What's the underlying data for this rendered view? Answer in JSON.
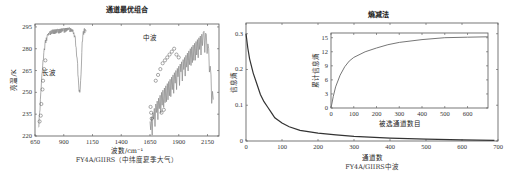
{
  "chart_data": [
    {
      "type": "line",
      "title": "通道最优组合",
      "xlabel": "波数/cm⁻¹",
      "ylabel": "亮温/K",
      "caption": "FY4A/GIIRS（中纬度夏季大气）",
      "xlim": [
        650,
        2250
      ],
      "ylim": [
        220,
        297
      ],
      "x_ticks": [
        650,
        900,
        1150,
        1400,
        1650,
        1900,
        2150
      ],
      "y_ticks": [
        220,
        235,
        250,
        265,
        280,
        295
      ],
      "grid": false,
      "annotations": [
        {
          "text": "长波",
          "x": 770,
          "y": 262
        },
        {
          "text": "中波",
          "x": 1650,
          "y": 286
        }
      ],
      "series": [
        {
          "name": "长波亮温谱",
          "x": [
            680,
            690,
            700,
            710,
            720,
            730,
            740,
            760,
            780,
            800,
            850,
            900,
            950,
            980,
            1000,
            1020,
            1030,
            1040,
            1050,
            1060,
            1070,
            1080,
            1090,
            1095
          ],
          "y": [
            226,
            236,
            250,
            262,
            272,
            280,
            286,
            290,
            292,
            293,
            293.5,
            294,
            294.5,
            293,
            288,
            270,
            255,
            250,
            262,
            285,
            292,
            294,
            293,
            292
          ]
        },
        {
          "name": "中波亮温谱",
          "x": [
            1650,
            1700,
            1750,
            1800,
            1850,
            1900,
            1950,
            2000,
            2050,
            2100,
            2120,
            2140,
            2160,
            2180,
            2200
          ],
          "y": [
            230,
            242,
            250,
            256,
            262,
            268,
            274,
            280,
            285,
            290,
            292,
            290,
            280,
            262,
            245
          ]
        },
        {
          "name": "选中通道",
          "marker": "circle",
          "x": [
            690,
            700,
            705,
            715,
            720,
            730,
            740,
            1655,
            1660,
            1665,
            1700,
            1720,
            1740,
            1760,
            1780,
            1800,
            1820,
            1840,
            1860,
            1880,
            1900,
            1750,
            1770
          ],
          "y": [
            230,
            234,
            242,
            252,
            258,
            266,
            272,
            240,
            236,
            232,
            258,
            262,
            266,
            270,
            272,
            274,
            276,
            278,
            280,
            276,
            274,
            236,
            238
          ]
        }
      ]
    },
    {
      "type": "line",
      "title": "熵减法",
      "xlabel": "通道数",
      "ylabel": "信息熵",
      "caption": "FY4A/GIIRS中波",
      "xlim": [
        0,
        700
      ],
      "ylim": [
        0,
        0.33
      ],
      "x_ticks": [
        0,
        100,
        200,
        300,
        400,
        500,
        600,
        700
      ],
      "y_ticks": [
        0,
        0.1,
        0.2,
        0.3
      ],
      "grid": false,
      "series": [
        {
          "name": "信息熵",
          "x": [
            0,
            5,
            10,
            20,
            30,
            40,
            50,
            60,
            70,
            80,
            100,
            120,
            150,
            200,
            250,
            300,
            400,
            500,
            600,
            690
          ],
          "y": [
            0.3,
            0.26,
            0.23,
            0.19,
            0.16,
            0.13,
            0.11,
            0.095,
            0.08,
            0.065,
            0.05,
            0.04,
            0.03,
            0.022,
            0.017,
            0.013,
            0.008,
            0.005,
            0.003,
            0.002
          ]
        }
      ],
      "inset": {
        "type": "line",
        "xlabel": "被选通道数目",
        "ylabel": "累计信息熵",
        "xlim": [
          0,
          690
        ],
        "ylim": [
          0,
          16
        ],
        "x_ticks": [
          0,
          100,
          200,
          300,
          400,
          500,
          600
        ],
        "y_ticks": [
          0,
          3,
          6,
          9,
          12,
          15
        ],
        "series": [
          {
            "name": "累计信息熵",
            "x": [
              0,
              10,
              20,
              40,
              60,
              80,
              100,
              150,
              200,
              250,
              300,
              400,
              500,
              600,
              690
            ],
            "y": [
              0,
              2.5,
              4.5,
              7,
              8.8,
              10,
              10.8,
              12,
              12.8,
              13.5,
              14,
              14.6,
              15,
              15.1,
              15.2
            ]
          }
        ]
      }
    }
  ]
}
